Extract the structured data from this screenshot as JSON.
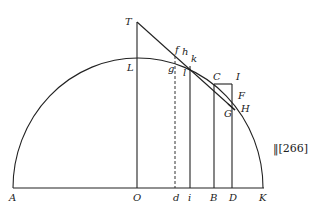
{
  "figure": {
    "type": "geometric-diagram",
    "page_reference": "‖[266]",
    "points": {
      "T": "T",
      "L": "L",
      "f": "f",
      "h": "h",
      "k": "k",
      "g": "g",
      "l": "l",
      "C": "C",
      "I": "I",
      "F": "F",
      "H": "H",
      "G": "G",
      "A": "A",
      "O": "O",
      "d": "d",
      "i": "i",
      "B": "B",
      "D": "D",
      "K": "K"
    }
  }
}
